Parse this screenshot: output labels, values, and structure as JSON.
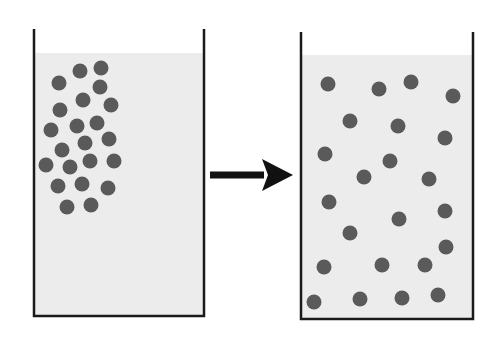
{
  "diagram": {
    "type": "diffusion-before-after",
    "colors": {
      "background": "#ffffff",
      "liquid": "#ececec",
      "particle": "#5a5a5a",
      "outline": "#1a1a1a",
      "arrow": "#111111"
    },
    "particle_radius": 7.5,
    "beakers": [
      {
        "id": "before",
        "wall_left": 34,
        "wall_right": 204,
        "wall_top": 29,
        "bottom": 316,
        "liquid_top": 53,
        "particles": [
          [
            80,
            71
          ],
          [
            101,
            68
          ],
          [
            59,
            83
          ],
          [
            100,
            87
          ],
          [
            83,
            100
          ],
          [
            60,
            110
          ],
          [
            111,
            105
          ],
          [
            51,
            130
          ],
          [
            77,
            126
          ],
          [
            97,
            123
          ],
          [
            85,
            143
          ],
          [
            109,
            139
          ],
          [
            62,
            150
          ],
          [
            46,
            165
          ],
          [
            70,
            167
          ],
          [
            90,
            161
          ],
          [
            114,
            161
          ],
          [
            58,
            186
          ],
          [
            82,
            184
          ],
          [
            108,
            188
          ],
          [
            67,
            207
          ],
          [
            91,
            205
          ]
        ]
      },
      {
        "id": "after",
        "wall_left": 301,
        "wall_right": 473,
        "wall_top": 32,
        "bottom": 319,
        "liquid_top": 55,
        "particles": [
          [
            328,
            84
          ],
          [
            379,
            89
          ],
          [
            411,
            82
          ],
          [
            453,
            96
          ],
          [
            350,
            121
          ],
          [
            398,
            126
          ],
          [
            445,
            138
          ],
          [
            325,
            154
          ],
          [
            390,
            161
          ],
          [
            364,
            177
          ],
          [
            429,
            179
          ],
          [
            329,
            202
          ],
          [
            399,
            219
          ],
          [
            445,
            211
          ],
          [
            350,
            233
          ],
          [
            446,
            247
          ],
          [
            324,
            267
          ],
          [
            382,
            265
          ],
          [
            425,
            265
          ],
          [
            314,
            302
          ],
          [
            360,
            299
          ],
          [
            402,
            298
          ],
          [
            438,
            295
          ]
        ]
      }
    ],
    "arrow": {
      "x1": 210,
      "x2": 293,
      "y": 175,
      "head_length": 31,
      "head_half_width": 16,
      "shaft_width": 7
    }
  }
}
